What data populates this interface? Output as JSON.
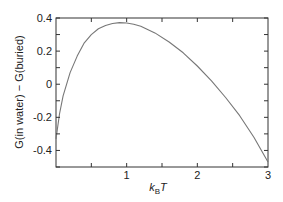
{
  "chart_data": {
    "type": "line",
    "title": "",
    "xlabel": "k_B T",
    "xlabel_main": "k",
    "xlabel_sub": "B",
    "xlabel_tail": "T",
    "ylabel": "G(in water) − G(buried)",
    "xlim": [
      0,
      3
    ],
    "ylim": [
      -0.5,
      0.4
    ],
    "x_ticks": [
      1,
      2,
      3
    ],
    "x_tick_labels": [
      "1",
      "2",
      "3"
    ],
    "y_ticks": [
      0.4,
      0.2,
      0,
      -0.2,
      -0.4
    ],
    "y_tick_labels": [
      "0.4",
      "0.2",
      "0",
      "-0.2",
      "-0.4"
    ],
    "grid": false,
    "legend": null,
    "series": [
      {
        "name": "G(in water) - G(buried)",
        "color": "#777777",
        "x": [
          0.0,
          0.05,
          0.1,
          0.2,
          0.3,
          0.4,
          0.5,
          0.6,
          0.7,
          0.8,
          0.9,
          1.0,
          1.1,
          1.2,
          1.4,
          1.6,
          1.8,
          2.0,
          2.2,
          2.4,
          2.6,
          2.8,
          3.0
        ],
        "y": [
          -0.33,
          -0.18,
          -0.07,
          0.07,
          0.17,
          0.25,
          0.3,
          0.335,
          0.355,
          0.367,
          0.372,
          0.37,
          0.362,
          0.35,
          0.31,
          0.255,
          0.19,
          0.11,
          0.02,
          -0.08,
          -0.19,
          -0.32,
          -0.47
        ]
      }
    ]
  }
}
